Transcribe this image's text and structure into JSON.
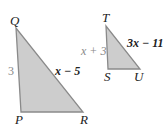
{
  "colors": {
    "fill": "#cdcdcd",
    "stroke": "#8a8a8a"
  },
  "triangle_pqr": {
    "vertices": {
      "Q": "Q",
      "P": "P",
      "R": "R"
    },
    "side_qp": "3",
    "side_qr": "x − 5"
  },
  "triangle_tsu": {
    "vertices": {
      "T": "T",
      "S": "S",
      "U": "U"
    },
    "side_ts": "x + 3",
    "side_tu": "3x − 11"
  }
}
